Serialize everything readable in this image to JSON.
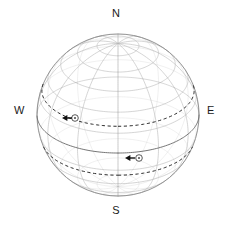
{
  "figure": {
    "name": "celestial-sphere-diagram",
    "background_color": "#ffffff"
  },
  "cardinals": {
    "north": "N",
    "south": "S",
    "west": "W",
    "east": "E"
  },
  "sphere": {
    "center_x": 118,
    "center_y": 115,
    "radius": 81,
    "outline_color": "#8a8a8a",
    "grid_color": "#b9b9b9",
    "equator_color": "#6f6f6f",
    "meridian_count": 12,
    "parallel_count": 11
  },
  "markers": [
    {
      "id": "upper-object",
      "glyph": "circle-dot",
      "x": 75,
      "y": 118,
      "arrow_direction": "left",
      "arrow_tip_x": 62,
      "arrow_tail_x": 72,
      "track_declination": 20,
      "track_style": "dashed",
      "track_color": "#2a2a2a"
    },
    {
      "id": "lower-object",
      "glyph": "circle-dot",
      "x": 139,
      "y": 158,
      "arrow_direction": "left",
      "arrow_tip_x": 125,
      "arrow_tail_x": 135,
      "track_declination": -20,
      "track_style": "dashed",
      "track_color": "#2a2a2a"
    }
  ]
}
